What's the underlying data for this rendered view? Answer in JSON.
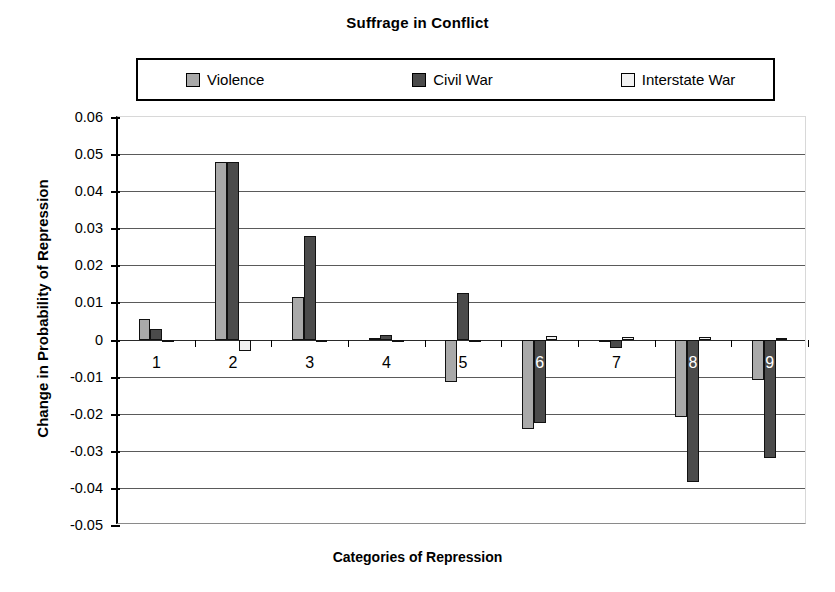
{
  "chart_data": {
    "type": "bar",
    "title": "Suffrage in Conflict",
    "xlabel": "Categories of Repression",
    "ylabel": "Change in Probability of Repression",
    "categories": [
      "1",
      "2",
      "3",
      "4",
      "5",
      "6",
      "7",
      "8",
      "9"
    ],
    "ylim": [
      -0.05,
      0.06
    ],
    "ytick_labels": [
      "0.06",
      "0.05",
      "0.04",
      "0.03",
      "0.02",
      "0.01",
      "0",
      "-0.01",
      "-0.02",
      "-0.03",
      "-0.04",
      "-0.05"
    ],
    "yticks": [
      0.06,
      0.05,
      0.04,
      0.03,
      0.02,
      0.01,
      0,
      -0.01,
      -0.02,
      -0.03,
      -0.04,
      -0.05
    ],
    "grid": true,
    "legend_position": "top",
    "series": [
      {
        "name": "Violence",
        "color": "#a9a9a9",
        "values": [
          0.0055,
          0.048,
          0.0115,
          0.0003,
          -0.0115,
          -0.024,
          -0.0008,
          -0.021,
          -0.011
        ]
      },
      {
        "name": "Civil War",
        "color": "#4b4b4b",
        "values": [
          0.0028,
          0.048,
          0.028,
          0.0013,
          0.0125,
          -0.0225,
          -0.0022,
          -0.0385,
          -0.032
        ]
      },
      {
        "name": "Interstate War",
        "color": "#f2f2f2",
        "values": [
          -0.0003,
          -0.003,
          -0.0005,
          0.0,
          -0.0002,
          0.001,
          0.0008,
          0.0008,
          0.0005
        ]
      }
    ]
  },
  "legend": {
    "items": [
      {
        "label": "Violence"
      },
      {
        "label": "Civil War"
      },
      {
        "label": "Interstate War"
      }
    ]
  }
}
